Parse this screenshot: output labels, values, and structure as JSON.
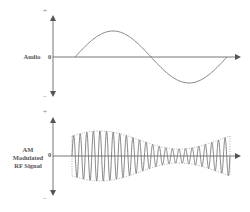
{
  "diagram": {
    "panels": [
      {
        "id": "audio",
        "label": "Audio",
        "plus_label": "+",
        "minus_label": "−",
        "zero_label": "0",
        "waveform": "sine (one full cycle)"
      },
      {
        "id": "am",
        "label_lines": [
          "AM",
          "Modulated",
          "RF Signal"
        ],
        "plus_label": "+",
        "minus_label": "−",
        "zero_label": "0",
        "waveform": "high-frequency carrier with dotted amplitude envelope following the audio signal"
      }
    ],
    "colors": {
      "axis": "#555555",
      "wave": "#777777",
      "envelope": "#888888"
    }
  }
}
